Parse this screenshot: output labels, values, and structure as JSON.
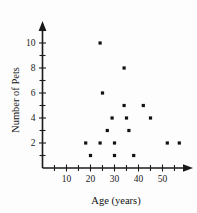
{
  "chart_data": {
    "type": "scatter",
    "title": "",
    "xlabel": "Age (years)",
    "ylabel": "Number of Pets",
    "xlim": [
      0,
      60
    ],
    "ylim": [
      0,
      11
    ],
    "grid": false,
    "legend": null,
    "x_ticks_major": [
      10,
      20,
      30,
      40,
      50
    ],
    "x_ticks_minor": [
      5,
      15,
      25,
      35,
      45,
      55
    ],
    "y_ticks_major": [
      2,
      4,
      6,
      8,
      10
    ],
    "y_ticks_minor": [
      1,
      3,
      5,
      7,
      9,
      11
    ],
    "x_tick_labels": [
      "10",
      "20",
      "30",
      "40",
      "50"
    ],
    "y_tick_labels": [
      "2",
      "4",
      "6",
      "8",
      "10"
    ],
    "point_count": 17,
    "points": [
      {
        "x": 24,
        "y": 10
      },
      {
        "x": 34,
        "y": 8
      },
      {
        "x": 25,
        "y": 6
      },
      {
        "x": 34,
        "y": 5
      },
      {
        "x": 42,
        "y": 5
      },
      {
        "x": 29,
        "y": 4
      },
      {
        "x": 35,
        "y": 4
      },
      {
        "x": 45,
        "y": 4
      },
      {
        "x": 27,
        "y": 3
      },
      {
        "x": 36,
        "y": 3
      },
      {
        "x": 18,
        "y": 2
      },
      {
        "x": 24,
        "y": 2
      },
      {
        "x": 30,
        "y": 2
      },
      {
        "x": 52,
        "y": 2
      },
      {
        "x": 57,
        "y": 2
      },
      {
        "x": 20,
        "y": 1
      },
      {
        "x": 30,
        "y": 1
      },
      {
        "x": 38,
        "y": 1
      }
    ],
    "marker": "square",
    "marker_color": "#111111",
    "axis_color": "#1a1a1a"
  }
}
